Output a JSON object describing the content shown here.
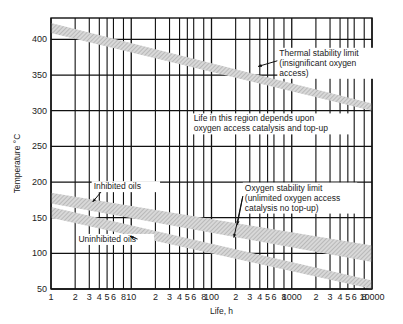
{
  "chart_data": {
    "type": "area",
    "title": "",
    "xlabel": "Life, h",
    "ylabel": "Temperature °C",
    "xscale": "log",
    "xlim": [
      1,
      10000
    ],
    "ylim": [
      50,
      430
    ],
    "grid": true,
    "x_tick_labels": [
      {
        "value": 1,
        "label": "1"
      },
      {
        "value": 2,
        "label": "2"
      },
      {
        "value": 3,
        "label": "3"
      },
      {
        "value": 4,
        "label": "4"
      },
      {
        "value": 5,
        "label": "5"
      },
      {
        "value": 6,
        "label": "6"
      },
      {
        "value": 8,
        "label": "8"
      },
      {
        "value": 10,
        "label": "10"
      },
      {
        "value": 20,
        "label": "2"
      },
      {
        "value": 30,
        "label": "3"
      },
      {
        "value": 40,
        "label": "4"
      },
      {
        "value": 50,
        "label": "5"
      },
      {
        "value": 60,
        "label": "6"
      },
      {
        "value": 80,
        "label": "8"
      },
      {
        "value": 100,
        "label": "100"
      },
      {
        "value": 200,
        "label": "2"
      },
      {
        "value": 300,
        "label": "3"
      },
      {
        "value": 400,
        "label": "4"
      },
      {
        "value": 500,
        "label": "5"
      },
      {
        "value": 600,
        "label": "6"
      },
      {
        "value": 800,
        "label": "8"
      },
      {
        "value": 1000,
        "label": "1000"
      },
      {
        "value": 2000,
        "label": "2"
      },
      {
        "value": 3000,
        "label": "3"
      },
      {
        "value": 4000,
        "label": "4"
      },
      {
        "value": 5000,
        "label": "5"
      },
      {
        "value": 6000,
        "label": "6"
      },
      {
        "value": 8000,
        "label": "8"
      },
      {
        "value": 10000,
        "label": "10000"
      }
    ],
    "y_ticks": [
      50,
      100,
      150,
      200,
      250,
      300,
      350,
      400
    ],
    "series": [
      {
        "name": "Thermal stability limit",
        "kind": "band",
        "x": [
          1,
          10000
        ],
        "upper": [
          423,
          310
        ],
        "lower": [
          409,
          300
        ]
      },
      {
        "name": "Inhibited oils",
        "kind": "band",
        "x": [
          1,
          10000
        ],
        "upper": [
          185,
          111
        ],
        "lower": [
          170,
          88
        ]
      },
      {
        "name": "Uninhibited oils",
        "kind": "band",
        "x": [
          1,
          10000
        ],
        "upper": [
          165,
          62
        ],
        "lower": [
          150,
          50
        ]
      }
    ],
    "annotations": [
      {
        "id": "thermal",
        "lines": [
          "Thermal stability limit",
          "(insignificant oxygen",
          "access)"
        ],
        "x": 700,
        "y": 377
      },
      {
        "id": "region",
        "lines": [
          "Life in this region depends upon",
          "oxygen access catalysis and top-up"
        ],
        "x": 60,
        "y": 285
      },
      {
        "id": "oxygen",
        "lines": [
          "Oxygen stability limit",
          "(unlimited oxygen access",
          "catalysis no top-up)"
        ],
        "x": 260,
        "y": 188
      },
      {
        "id": "inhibited",
        "lines": [
          "Inhibited oils"
        ],
        "x": 3.4,
        "y": 190
      },
      {
        "id": "uninhibited",
        "lines": [
          "Uninhibited oils"
        ],
        "x": 2.2,
        "y": 116
      }
    ]
  }
}
